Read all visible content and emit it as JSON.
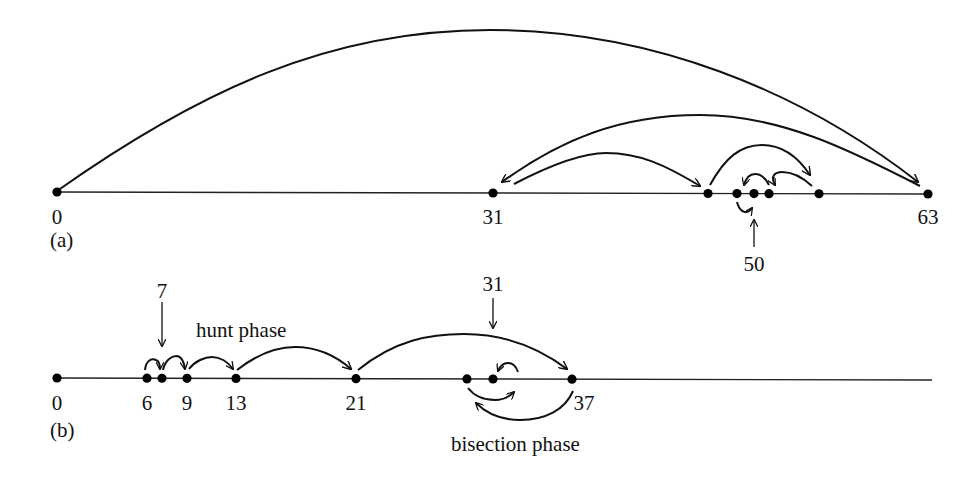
{
  "diagram": {
    "panel_a": {
      "caption": "(a)",
      "axis_range": [
        0,
        63
      ],
      "points": [
        {
          "value": 0,
          "label": "0"
        },
        {
          "value": 31,
          "label": "31"
        },
        {
          "value": 44,
          "label": ""
        },
        {
          "value": 47,
          "label": ""
        },
        {
          "value": 50,
          "label": ""
        },
        {
          "value": 51,
          "label": ""
        },
        {
          "value": 55,
          "label": ""
        },
        {
          "value": 63,
          "label": "63"
        }
      ],
      "pointer_label": "50",
      "jumps": [
        {
          "from": 0,
          "to": 63
        },
        {
          "from": 63,
          "to": 31
        },
        {
          "from": 31,
          "to": 44
        },
        {
          "from": 44,
          "to": 55
        },
        {
          "from": 55,
          "to": 51
        },
        {
          "from": 51,
          "to": 47
        },
        {
          "from": 47,
          "to": 50
        }
      ]
    },
    "panel_b": {
      "caption": "(b)",
      "points": [
        {
          "value": 0,
          "label": "0"
        },
        {
          "value": 6,
          "label": "6"
        },
        {
          "value": 7,
          "label": ""
        },
        {
          "value": 9,
          "label": "9"
        },
        {
          "value": 13,
          "label": "13"
        },
        {
          "value": 21,
          "label": "21"
        },
        {
          "value": 29,
          "label": ""
        },
        {
          "value": 31,
          "label": ""
        },
        {
          "value": 37,
          "label": "37"
        }
      ],
      "pointer_top_left_label": "7",
      "pointer_top_right_label": "31",
      "hunt_phase_label": "hunt phase",
      "bisection_phase_label": "bisection phase",
      "hunt_jumps": [
        {
          "from": 6,
          "to": 7
        },
        {
          "from": 7,
          "to": 9
        },
        {
          "from": 9,
          "to": 13
        },
        {
          "from": 13,
          "to": 21
        },
        {
          "from": 21,
          "to": 37
        }
      ],
      "bisection_jumps": [
        {
          "from": 37,
          "to": 29
        },
        {
          "from": 29,
          "to": 33
        },
        {
          "from": 33,
          "to": 31
        }
      ]
    }
  }
}
